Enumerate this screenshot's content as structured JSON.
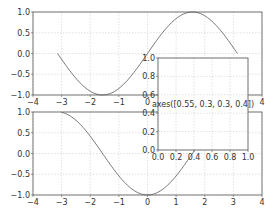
{
  "chart_data": [
    {
      "type": "line",
      "name": "top-subplot",
      "title": "",
      "xlabel": "",
      "ylabel": "",
      "xlim": [
        -4,
        4
      ],
      "ylim": [
        -1.0,
        1.0
      ],
      "grid": true,
      "xticks": [
        "-4",
        "-3",
        "-2",
        "-1",
        "0",
        "1",
        "2",
        "3",
        "4"
      ],
      "yticks": [
        "1.0",
        "0.5",
        "0.0",
        "-0.5",
        "-1.0"
      ],
      "series": [
        {
          "name": "sin(x)",
          "function": "sin",
          "x_range": [
            -3.14159,
            3.14159
          ]
        }
      ]
    },
    {
      "type": "line",
      "name": "bottom-subplot",
      "title": "",
      "xlabel": "",
      "ylabel": "",
      "xlim": [
        -4,
        4
      ],
      "ylim": [
        -1.0,
        1.0
      ],
      "grid": true,
      "xticks": [
        "-4",
        "-3",
        "-2",
        "-1",
        "0",
        "1",
        "2",
        "3",
        "4"
      ],
      "yticks": [
        "1.0",
        "0.5",
        "0.0",
        "-0.5",
        "-1.0"
      ],
      "series": [
        {
          "name": "cos(x)",
          "function": "-cos",
          "x_range": [
            -3.0,
            3.0
          ],
          "note": "rises from -1 at x=-3 to 1 near x=0 then falls to -1 at x=3"
        }
      ]
    },
    {
      "type": "line",
      "name": "inset-axes",
      "title": "",
      "xlim": [
        0.0,
        1.0
      ],
      "ylim": [
        0.0,
        1.0
      ],
      "grid": true,
      "xticks": [
        "0.0",
        "0.2",
        "0.4",
        "0.6",
        "0.8",
        "1.0"
      ],
      "yticks": [
        "1.0",
        "0.8",
        "0.6",
        "0.4",
        "0.2",
        "0.0"
      ],
      "annotation": "axes([0.55, 0.3, 0.3, 0.4])",
      "series": []
    }
  ]
}
